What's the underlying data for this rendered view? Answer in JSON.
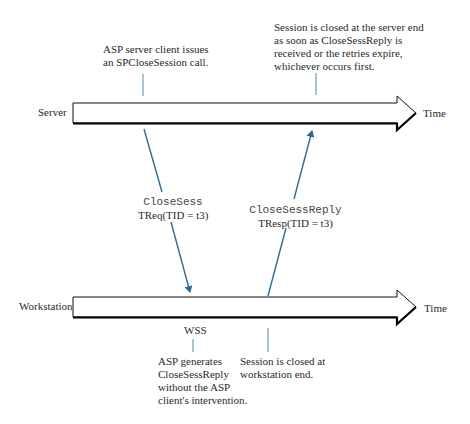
{
  "diagram": {
    "lanes": {
      "server": {
        "label": "Server",
        "axis_label": "Time"
      },
      "workstation": {
        "label": "Workstation",
        "axis_label": "Time"
      }
    },
    "annotations": {
      "server_client_call": {
        "line1": "ASP server client issues",
        "line2": "an SPCloseSession call."
      },
      "server_close": {
        "line1": "Session is closed at the server end",
        "line2": "as soon as CloseSessReply is",
        "line3": "received or the retries expire,",
        "line4": "whichever occurs first."
      },
      "wss": {
        "label": "WSS"
      },
      "asp_generates": {
        "line1": "ASP generates",
        "line2": "CloseSessReply",
        "line3": "without the ASP",
        "line4": "client's intervention."
      },
      "workstation_close": {
        "line1": "Session is closed at",
        "line2": "workstation end."
      }
    },
    "messages": {
      "request": {
        "name": "CloseSess",
        "detail": "TReq(TID = t3)",
        "direction": "server-to-workstation"
      },
      "response": {
        "name": "CloseSessReply",
        "detail": "TResp(TID = t3)",
        "direction": "workstation-to-server"
      }
    },
    "colors": {
      "message_arrow": "#2f6a8f",
      "tick_line": "#6a9fb5",
      "lane_outline": "#111111"
    }
  }
}
